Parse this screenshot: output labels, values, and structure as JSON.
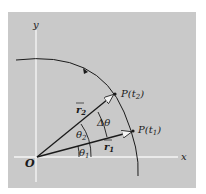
{
  "diagram": {
    "axes": {
      "x_label": "x",
      "y_label": "y",
      "origin_label": "O"
    },
    "points": [
      {
        "label": "P(t₂)",
        "base": "P(t",
        "sub": "2",
        "close": ")"
      },
      {
        "label": "P(t₁)",
        "base": "P(t",
        "sub": "1",
        "close": ")"
      }
    ],
    "vectors": [
      {
        "label": "r₂",
        "base": "r",
        "sub": "2"
      },
      {
        "label": "r₁",
        "base": "r",
        "sub": "1"
      }
    ],
    "angles": [
      {
        "label": "θ₂",
        "base": "θ",
        "sub": "2"
      },
      {
        "label": "θ₁",
        "base": "θ",
        "sub": "1"
      },
      {
        "label": "Δθ"
      }
    ],
    "colors": {
      "background": "#c9c9c9",
      "axis": "#f4f4f4",
      "ink": "#1a1a1a"
    }
  }
}
